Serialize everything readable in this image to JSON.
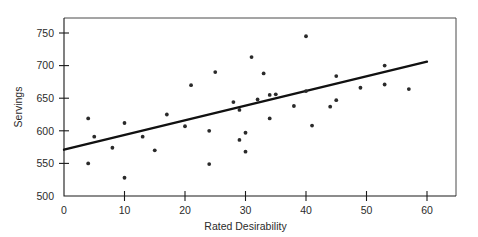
{
  "chart_data": {
    "type": "scatter",
    "title": "",
    "xlabel": "Rated Desirability",
    "ylabel": "Servings",
    "xlim": [
      0,
      65
    ],
    "ylim": [
      500,
      765
    ],
    "xticks": [
      0,
      10,
      20,
      30,
      40,
      50,
      60
    ],
    "yticks": [
      500,
      550,
      600,
      650,
      700,
      750
    ],
    "grid": false,
    "legend": null,
    "series": [
      {
        "name": "Observations",
        "points": [
          [
            4,
            619
          ],
          [
            4,
            550
          ],
          [
            5,
            591
          ],
          [
            8,
            574
          ],
          [
            10,
            612
          ],
          [
            10,
            528
          ],
          [
            13,
            591
          ],
          [
            15,
            570
          ],
          [
            17,
            625
          ],
          [
            20,
            607
          ],
          [
            21,
            670
          ],
          [
            24,
            549
          ],
          [
            24,
            600
          ],
          [
            25,
            690
          ],
          [
            28,
            644
          ],
          [
            29,
            632
          ],
          [
            29,
            586
          ],
          [
            30,
            597
          ],
          [
            30,
            568
          ],
          [
            31,
            713
          ],
          [
            32,
            648
          ],
          [
            33,
            688
          ],
          [
            34,
            655
          ],
          [
            34,
            619
          ],
          [
            35,
            656
          ],
          [
            38,
            638
          ],
          [
            40,
            745
          ],
          [
            40,
            661
          ],
          [
            41,
            608
          ],
          [
            44,
            637
          ],
          [
            45,
            684
          ],
          [
            45,
            647
          ],
          [
            49,
            666
          ],
          [
            53,
            700
          ],
          [
            53,
            671
          ],
          [
            57,
            664
          ]
        ]
      }
    ],
    "trendline": {
      "name": "Least-squares regression line",
      "x_start": 0,
      "y_start": 571,
      "x_end": 60,
      "y_end": 706
    }
  }
}
